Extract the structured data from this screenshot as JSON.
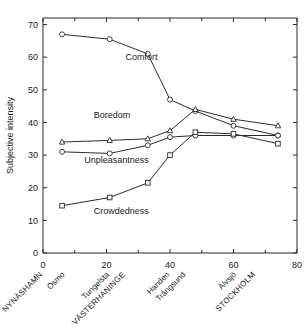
{
  "chart_data": {
    "type": "line",
    "title": "",
    "xlabel": "",
    "ylabel": "Subjective intensity",
    "xlim": [
      0,
      80
    ],
    "ylim": [
      0,
      72
    ],
    "ytick_values": [
      0,
      10,
      20,
      30,
      40,
      50,
      60,
      70
    ],
    "ytick_labels": [
      "0",
      "10",
      "20",
      "30",
      "40",
      "50",
      "60",
      "70"
    ],
    "xtick_values": [
      0,
      20,
      40,
      60,
      80
    ],
    "xtick_labels": [
      "0",
      "20",
      "40",
      "60",
      "80"
    ],
    "xminor_values": [
      10,
      30,
      50,
      70
    ],
    "grid": false,
    "legend": "inline-annotations",
    "station_labels": [
      {
        "name": "NYNÄSHAMN",
        "x": 0,
        "caps": true
      },
      {
        "name": "Ösmo",
        "x": 7,
        "caps": false
      },
      {
        "name": "Tungelsta",
        "x": 21,
        "caps": false
      },
      {
        "name": "VÄSTERHANINGE",
        "x": 26,
        "caps": true
      },
      {
        "name": "Handen",
        "x": 40,
        "caps": false
      },
      {
        "name": "Trångsund",
        "x": 45,
        "caps": false
      },
      {
        "name": "Älvsjö",
        "x": 61,
        "caps": false
      },
      {
        "name": "STOCKHOLM",
        "x": 67,
        "caps": true
      }
    ],
    "x": [
      6,
      21,
      33,
      40,
      48,
      60,
      74
    ],
    "series": [
      {
        "name": "Comfort",
        "marker": "circle",
        "label_x": 26,
        "label_y": 59,
        "values": [
          67,
          65.5,
          61,
          47,
          43.5,
          39,
          36
        ]
      },
      {
        "name": "Boredom",
        "marker": "triangle",
        "label_x": 16,
        "label_y": 41.5,
        "values": [
          34,
          34.5,
          35,
          37.5,
          44,
          41,
          39
        ]
      },
      {
        "name": "Unpleasantness",
        "marker": "circle",
        "label_x": 13,
        "label_y": 27.5,
        "values": [
          31,
          30.5,
          33,
          35.5,
          36,
          36,
          36
        ]
      },
      {
        "name": "Crowdedness",
        "marker": "square",
        "label_x": 16,
        "label_y": 12,
        "values": [
          14.5,
          17,
          21.5,
          30,
          37,
          36.5,
          33.5
        ]
      }
    ]
  }
}
